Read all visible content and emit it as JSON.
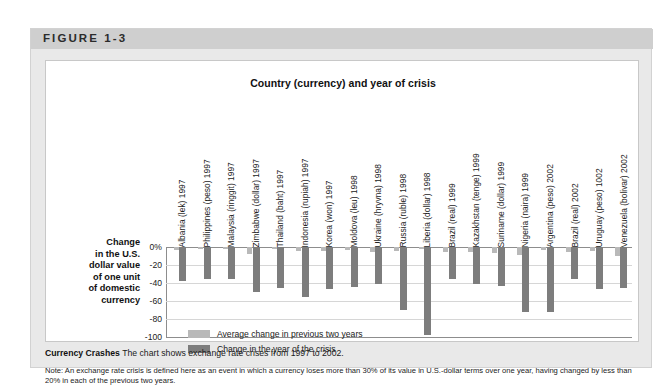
{
  "figure": {
    "number_label": "FIGURE 1-3"
  },
  "caption": {
    "lead": "Currency Crashes",
    "text": "The chart shows exchange rate crises from 1997 to 2002.",
    "note": "Note: An exchange rate crisis is defined here as an event in which a currency loses more than 30% of its value in U.S.-dollar terms over one year, having changed by less than 20% in each of the previous two years."
  },
  "axis_title": {
    "line1": "Change",
    "line2": "in the U.S.",
    "line3": "dollar value",
    "line4": "of one unit",
    "line5": "of domestic",
    "line6": "currency"
  },
  "legend": {
    "items": [
      {
        "label": "Average change in previous two years",
        "color": "#b9b9b9"
      },
      {
        "label": "Change in the year of the crisis",
        "color": "#7d7d7d"
      }
    ]
  },
  "chart_data": {
    "type": "bar",
    "title": "Country (currency) and year of crisis",
    "xlabel": "Country (currency) and year of crisis",
    "ylabel": "Change in the U.S. dollar value of one unit of domestic currency",
    "ylim": [
      -100,
      0
    ],
    "yticks": [
      "0%",
      "-20",
      "-40",
      "-60",
      "-80",
      "-100"
    ],
    "ytick_values": [
      0,
      -20,
      -40,
      -60,
      -80,
      -100
    ],
    "grid": true,
    "legend_position": "inside-lower-left",
    "categories": [
      "Albania (lek) 1997",
      "Philippines (peso) 1997",
      "Malaysia (ringgit) 1997",
      "Zimbabwe (dollar) 1997",
      "Thailand (baht) 1997",
      "Indonesia (rupiah) 1997",
      "Korea (won) 1997",
      "Moldova (leu) 1998",
      "Ukraine (hryvna) 1998",
      "Russia (ruble) 1998",
      "Liberia (dollar) 1998",
      "Brazil (real) 1999",
      "Kazakhstan (tenge) 1999",
      "Suriname (dollar) 1999",
      "Nigeria (naira) 1999",
      "Argentina (peso) 2002",
      "Brazil (real) 2002",
      "Uruguay (peso) 1002",
      "Venezuela (bolivar) 2002"
    ],
    "series": [
      {
        "name": "Average change in previous two years",
        "color": "#b9b9b9",
        "values": [
          -3,
          -2,
          -2,
          -8,
          -2,
          -4,
          -4,
          -3,
          -6,
          -4,
          -2,
          -5,
          -5,
          -7,
          -9,
          -3,
          -6,
          -4,
          -10
        ]
      },
      {
        "name": "Change in the year of the crisis",
        "color": "#7d7d7d",
        "values": [
          -38,
          -36,
          -35,
          -50,
          -45,
          -56,
          -47,
          -44,
          -41,
          -70,
          -98,
          -35,
          -41,
          -43,
          -72,
          -72,
          -35,
          -47,
          -46
        ]
      }
    ]
  }
}
